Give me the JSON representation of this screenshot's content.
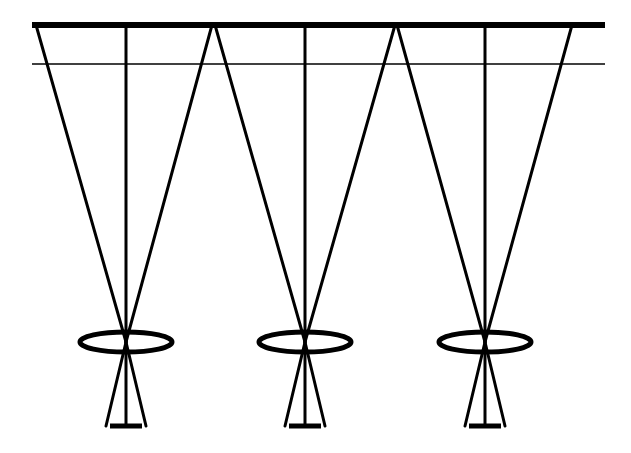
{
  "diagram": {
    "title": "",
    "colors": {
      "stroke": "#000000",
      "background": "#ffffff"
    },
    "planes": {
      "top_surface": {
        "y": 25,
        "x1": 32,
        "x2": 605,
        "stroke_width": 6
      },
      "reference_line": {
        "y": 64,
        "x1": 32,
        "x2": 605,
        "stroke_width": 1.5
      }
    },
    "cameras": [
      {
        "id": "camera-1",
        "center_x": 126,
        "fov_left_x": 36,
        "fov_right_x": 212
      },
      {
        "id": "camera-2",
        "center_x": 305,
        "fov_left_x": 215,
        "fov_right_x": 395
      },
      {
        "id": "camera-3",
        "center_x": 485,
        "fov_left_x": 397,
        "fov_right_x": 572
      }
    ],
    "lens": {
      "y": 342,
      "rx": 46,
      "ry": 10,
      "stroke_width": 5
    },
    "sensor": {
      "y": 426,
      "cone_half_width": 20,
      "bar_half_width": 16,
      "stroke_width": 5
    },
    "ray_stroke_width": 3
  }
}
